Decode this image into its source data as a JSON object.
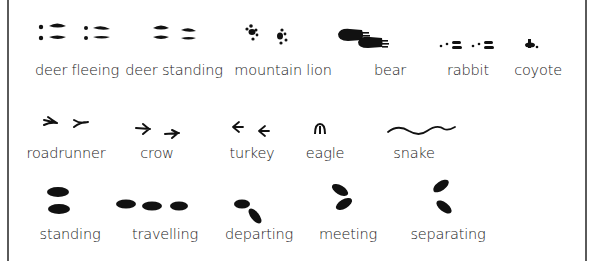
{
  "rows": [
    {
      "name": "animal-tracks-row-1",
      "items": [
        {
          "label": "deer fleeing",
          "icon": "deer-fleeing-track-icon"
        },
        {
          "label": "deer standing",
          "icon": "deer-standing-track-icon"
        },
        {
          "label": "mountain lion",
          "icon": "mountain-lion-track-icon"
        },
        {
          "label": "bear",
          "icon": "bear-track-icon"
        },
        {
          "label": "rabbit",
          "icon": "rabbit-track-icon"
        },
        {
          "label": "coyote",
          "icon": "coyote-track-icon"
        }
      ]
    },
    {
      "name": "animal-tracks-row-2",
      "items": [
        {
          "label": "roadrunner",
          "icon": "roadrunner-track-icon"
        },
        {
          "label": "crow",
          "icon": "crow-track-icon"
        },
        {
          "label": "turkey",
          "icon": "turkey-track-icon"
        },
        {
          "label": "eagle",
          "icon": "eagle-track-icon"
        },
        {
          "label": "snake",
          "icon": "snake-track-icon"
        }
      ]
    },
    {
      "name": "movement-row",
      "items": [
        {
          "label": "standing",
          "icon": "standing-mark-icon"
        },
        {
          "label": "travelling",
          "icon": "travelling-mark-icon"
        },
        {
          "label": "departing",
          "icon": "departing-mark-icon"
        },
        {
          "label": "meeting",
          "icon": "meeting-mark-icon"
        },
        {
          "label": "separating",
          "icon": "separating-mark-icon"
        }
      ]
    }
  ],
  "colors": {
    "ink": "#111111",
    "frame": "#5a5a5a",
    "background": "#ffffff"
  }
}
